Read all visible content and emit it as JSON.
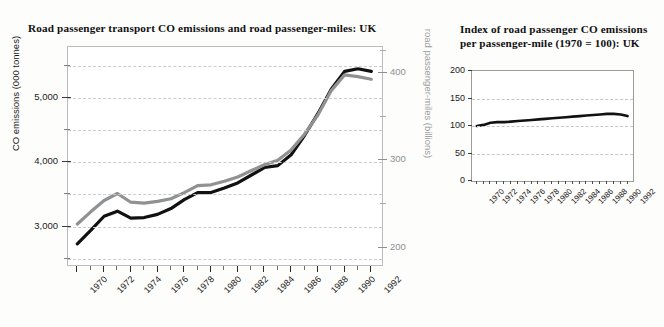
{
  "page": {
    "background": "#fdfdfc"
  },
  "figures": [
    {
      "id": "left",
      "title": "Road passenger transport CO emissions and road passenger-miles: UK"
    },
    {
      "id": "right",
      "title": "Index of road passenger CO emissions per passenger-mile (1970 = 100): UK"
    }
  ],
  "colors": {
    "series_co": "#111111",
    "series_miles": "#8f9193",
    "grid": "#c9cbcd",
    "frame": "#b9bbbd",
    "right_axis_text": "#8d8f91"
  },
  "chart_data": [
    {
      "type": "line",
      "title": "Road passenger transport CO emissions and road passenger-miles: UK",
      "xlabel": "",
      "ylabel": "CO emissions (000 tonnes)",
      "ylabel_secondary": "road passenger-miles (billions)",
      "x": [
        1970,
        1971,
        1972,
        1973,
        1974,
        1975,
        1976,
        1977,
        1978,
        1979,
        1980,
        1981,
        1982,
        1983,
        1984,
        1985,
        1986,
        1987,
        1988,
        1989,
        1990,
        1991,
        1992
      ],
      "xlim": [
        1969.3,
        1992.8
      ],
      "xtick_labels": [
        "1970",
        "1972",
        "1974",
        "1976",
        "1978",
        "1980",
        "1982",
        "1984",
        "1986",
        "1988",
        "1990",
        "1992"
      ],
      "xtick_values": [
        1970,
        1972,
        1974,
        1976,
        1978,
        1980,
        1982,
        1984,
        1986,
        1988,
        1990,
        1992
      ],
      "xtick_minor_values": [
        1971,
        1973,
        1975,
        1977,
        1979,
        1981,
        1983,
        1985,
        1987,
        1989,
        1991
      ],
      "ylim": [
        2400,
        5800
      ],
      "ytick_labels": [
        "3,000",
        "4,000",
        "5,000"
      ],
      "ytick_values": [
        3000,
        4000,
        5000
      ],
      "ytick_minor_values": [
        2500,
        3500,
        4500,
        5500
      ],
      "ylim_secondary": [
        180,
        430
      ],
      "ytick_labels_secondary": [
        "200",
        "300",
        "400"
      ],
      "ytick_values_secondary": [
        200,
        300,
        400
      ],
      "ytick_minor_values_secondary": [
        250,
        350,
        425
      ],
      "grid": true,
      "legend": "none",
      "series": [
        {
          "name": "CO emissions (000 tonnes)",
          "axis": "left",
          "color": "#111111",
          "values": [
            2730,
            2940,
            3160,
            3240,
            3130,
            3140,
            3190,
            3280,
            3420,
            3530,
            3530,
            3600,
            3680,
            3800,
            3920,
            3950,
            4120,
            4420,
            4760,
            5140,
            5420,
            5460,
            5420,
            4930
          ]
        },
        {
          "name": "road passenger-miles (billions)",
          "axis": "right",
          "color": "#8f9193",
          "values": [
            227,
            241,
            254,
            262,
            252,
            251,
            253,
            256,
            263,
            271,
            272,
            276,
            281,
            288,
            295,
            300,
            312,
            330,
            352,
            380,
            398,
            396,
            393,
            395
          ]
        }
      ]
    },
    {
      "type": "line",
      "title": "Index of road passenger CO emissions per passenger-mile (1970 = 100): UK",
      "xlabel": "",
      "ylabel": "",
      "x": [
        1970,
        1971,
        1972,
        1973,
        1974,
        1975,
        1976,
        1977,
        1978,
        1979,
        1980,
        1981,
        1982,
        1983,
        1984,
        1985,
        1986,
        1987,
        1988,
        1989,
        1990,
        1991,
        1992
      ],
      "xlim": [
        1969.3,
        1992.8
      ],
      "xtick_labels": [
        "1970",
        "1972",
        "1974",
        "1976",
        "1978",
        "1980",
        "1982",
        "1984",
        "1986",
        "1988",
        "1990",
        "1992"
      ],
      "xtick_values": [
        1970,
        1972,
        1974,
        1976,
        1978,
        1980,
        1982,
        1984,
        1986,
        1988,
        1990,
        1992
      ],
      "xtick_minor_values": [
        1971,
        1973,
        1975,
        1977,
        1979,
        1981,
        1983,
        1985,
        1987,
        1989,
        1991
      ],
      "ylim": [
        0,
        200
      ],
      "ytick_labels": [
        "0",
        "50",
        "100",
        "150",
        "200"
      ],
      "ytick_values": [
        0,
        50,
        100,
        150,
        200
      ],
      "grid": true,
      "legend": "none",
      "series": [
        {
          "name": "Index of road passenger CO emissions per passenger-mile",
          "axis": "left",
          "color": "#111111",
          "values": [
            100,
            102,
            106,
            107,
            107,
            108,
            109,
            110,
            111,
            112,
            113,
            114,
            115,
            116,
            117,
            118,
            119,
            120,
            121,
            122,
            122,
            121,
            118,
            107
          ]
        }
      ]
    }
  ]
}
